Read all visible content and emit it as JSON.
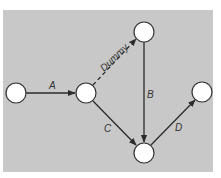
{
  "diagram": {
    "type": "activity-on-arrow network",
    "background_color": "#c8c8c8",
    "line_color": "#2b2b2b",
    "node_fill": "#ffffff",
    "frame": {
      "x": 3,
      "y": 10,
      "width": 210,
      "height": 162
    },
    "nodes": [
      {
        "id": "n1",
        "cx": 16,
        "cy": 93,
        "r": 10
      },
      {
        "id": "n2",
        "cx": 86,
        "cy": 93,
        "r": 10
      },
      {
        "id": "n3",
        "cx": 144,
        "cy": 32,
        "r": 10
      },
      {
        "id": "n4",
        "cx": 144,
        "cy": 153,
        "r": 10
      },
      {
        "id": "n5",
        "cx": 202,
        "cy": 92,
        "r": 10
      }
    ],
    "edges": [
      {
        "id": "A",
        "label": "A",
        "from": "n1",
        "to": "n2",
        "style": "solid"
      },
      {
        "id": "Dummy",
        "label": "Dummy",
        "from": "n2",
        "to": "n3",
        "style": "dashed"
      },
      {
        "id": "B",
        "label": "B",
        "from": "n3",
        "to": "n4",
        "style": "solid"
      },
      {
        "id": "C",
        "label": "C",
        "from": "n2",
        "to": "n4",
        "style": "solid"
      },
      {
        "id": "D",
        "label": "D",
        "from": "n4",
        "to": "n5",
        "style": "solid"
      }
    ]
  }
}
